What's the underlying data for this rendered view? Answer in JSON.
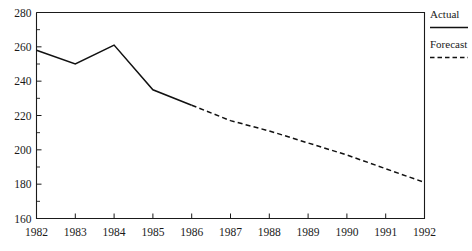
{
  "chart_data": {
    "type": "line",
    "title": "",
    "subtitle": "",
    "xlabel": "",
    "ylabel": "",
    "grid": false,
    "xlim": [
      1982,
      1992
    ],
    "ylim": [
      160,
      280
    ],
    "y_ticks": [
      160,
      180,
      200,
      220,
      240,
      260,
      280
    ],
    "y_minor_ticks": [
      170,
      190,
      210,
      230,
      250,
      270
    ],
    "x_ticks": [
      1982,
      1983,
      1984,
      1985,
      1986,
      1987,
      1988,
      1989,
      1990,
      1991,
      1992
    ],
    "x": [
      1982,
      1983,
      1984,
      1985,
      1986,
      1987,
      1988,
      1989,
      1990,
      1991,
      1992
    ],
    "legend_position": "right",
    "series": [
      {
        "name": "Actual",
        "style": "solid",
        "x": [
          1982,
          1983,
          1984,
          1985,
          1986
        ],
        "values": [
          258,
          250,
          261,
          235,
          226
        ]
      },
      {
        "name": "Forecast",
        "style": "dashed",
        "x": [
          1986,
          1987,
          1988,
          1989,
          1990,
          1991,
          1992
        ],
        "values": [
          226,
          217,
          211,
          204,
          197,
          189,
          181
        ]
      }
    ]
  },
  "axes": {
    "y_tick_labels": [
      "160",
      "180",
      "200",
      "220",
      "240",
      "260",
      "280"
    ],
    "x_tick_labels": [
      "1982",
      "1983",
      "1984",
      "1985",
      "1986",
      "1987",
      "1988",
      "1989",
      "1990",
      "1991",
      "1992"
    ]
  },
  "legend": {
    "items": [
      {
        "label": "Actual",
        "style": "solid"
      },
      {
        "label": "Forecast",
        "style": "dashed"
      }
    ]
  },
  "colors": {
    "line": "#111111",
    "axis": "#1a1a1a",
    "background": "#ffffff"
  }
}
